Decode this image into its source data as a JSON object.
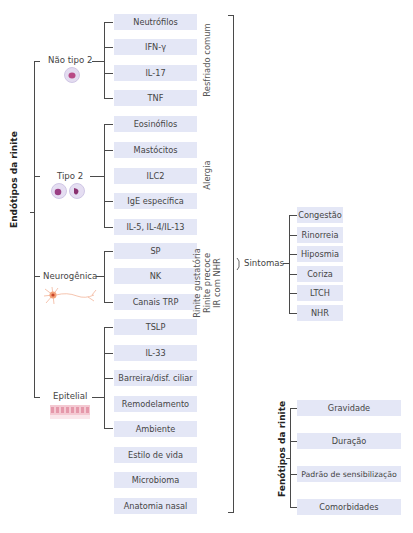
{
  "endotypes": {
    "title": "Endótipos da rinite",
    "groups": [
      {
        "label": "Não tipo 2",
        "icon": "cell-icon",
        "items": [
          "Neutrófilos",
          "IFN-γ",
          "IL-17",
          "TNF"
        ]
      },
      {
        "label": "Tipo 2",
        "icon": "granulocyte-icons",
        "items": [
          "Eosinófilos",
          "Mastócitos",
          "ILC2",
          "IgE específica",
          "IL-5, IL-4/IL-13"
        ]
      },
      {
        "label": "Neurogênica",
        "icon": "neuron-icon",
        "items": [
          "SP",
          "NK",
          "Canais TRP"
        ]
      },
      {
        "label": "Epitelial",
        "icon": "epithelium-icon",
        "items": [
          "TSLP",
          "IL-33",
          "Barreira/disf. ciliar",
          "Remodelamento"
        ]
      }
    ],
    "other_factors": [
      "Ambiente",
      "Estilo de vida",
      "Microbioma",
      "Anatomia nasal"
    ]
  },
  "conditions": {
    "common_cold": "Resfriado comum",
    "allergy": "Alergia",
    "other": [
      "Rinite gustatória",
      "Rinite precoce",
      "IR com NHR"
    ]
  },
  "symptoms": {
    "label": "Sintomas",
    "items": [
      "Congestão",
      "Rinorreia",
      "Hiposmia",
      "Coriza",
      "LTCH",
      "NHR"
    ]
  },
  "phenotypes": {
    "title": "Fenótipos da rinite",
    "items": [
      "Gravidade",
      "Duração",
      "Padrão de sensibilização",
      "Comorbidades"
    ]
  },
  "colors": {
    "box": "#e4e7f6",
    "line": "#4a4a4a"
  }
}
